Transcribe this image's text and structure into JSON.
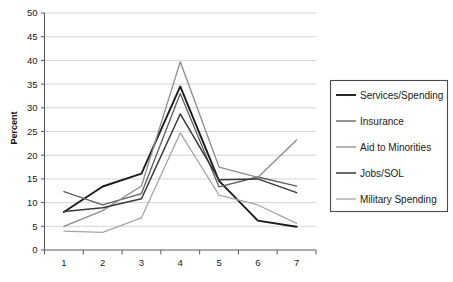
{
  "chart_data": {
    "type": "line",
    "title": "",
    "xlabel": "",
    "ylabel": "Percent",
    "categories": [
      "1",
      "2",
      "3",
      "4",
      "5",
      "6",
      "7"
    ],
    "x": [
      1,
      2,
      3,
      4,
      5,
      6,
      7
    ],
    "ylim": [
      0,
      50
    ],
    "ytick_step": 5,
    "yticks": [
      "0",
      "5",
      "10",
      "15",
      "20",
      "25",
      "30",
      "35",
      "40",
      "45",
      "50"
    ],
    "grid": "horizontal",
    "legend_position": "right-outside",
    "series": [
      {
        "name": "Services/Spending",
        "color": "#1c1c1c",
        "width": 1.9,
        "values": [
          8.0,
          13.4,
          16.1,
          34.5,
          14.6,
          6.2,
          4.9
        ]
      },
      {
        "name": "Insurance",
        "color": "#5e5e5e",
        "width": 1.3,
        "values": [
          12.3,
          9.5,
          11.9,
          33.0,
          13.3,
          15.4,
          13.5
        ]
      },
      {
        "name": "Aid to Minorities",
        "color": "#8c8c8c",
        "width": 1.3,
        "values": [
          5.0,
          8.3,
          13.5,
          39.7,
          17.5,
          15.3,
          23.2
        ]
      },
      {
        "name": "Jobs/SOL",
        "color": "#3a3a3a",
        "width": 1.5,
        "values": [
          8.1,
          8.9,
          10.8,
          28.7,
          14.8,
          15.0,
          12.1
        ]
      },
      {
        "name": "Military Spending",
        "color": "#a6a6a6",
        "width": 1.3,
        "values": [
          4.0,
          3.7,
          6.8,
          24.7,
          11.6,
          9.5,
          5.6
        ]
      }
    ]
  },
  "axes": {
    "y_axis_title": "Percent",
    "gridline_color": "#c9c9c9",
    "axis_color": "#5a5a5a"
  },
  "legend": {
    "entries": [
      {
        "label": "Services/Spending"
      },
      {
        "label": "Insurance"
      },
      {
        "label": "Aid to Minorities"
      },
      {
        "label": "Jobs/SOL"
      },
      {
        "label": "Military Spending"
      }
    ]
  }
}
